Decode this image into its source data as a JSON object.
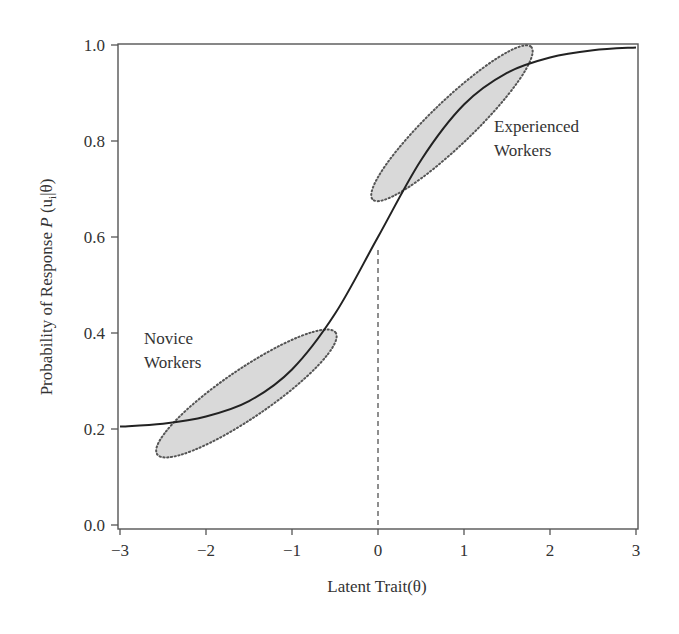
{
  "chart_data": {
    "type": "line",
    "title": "",
    "xlabel": "Latent Trait(θ)",
    "ylabel": {
      "prefix": "Probability of Response ",
      "italic": "P",
      "open": " (u",
      "subscript": "i",
      "close": "|θ)"
    },
    "xlim": [
      -3,
      3
    ],
    "ylim": [
      0.0,
      1.0
    ],
    "grid": false,
    "legend": null,
    "x_ticks": [
      -3,
      -2,
      -1,
      0,
      1,
      2,
      3
    ],
    "x_tick_labels": [
      "−3",
      "−2",
      "−1",
      "0",
      "1",
      "2",
      "3"
    ],
    "y_ticks": [
      0.0,
      0.2,
      0.4,
      0.6,
      0.8,
      1.0
    ],
    "y_tick_labels": [
      "0.0",
      "0.2",
      "0.4",
      "0.6",
      "0.8",
      "1.0"
    ],
    "series": [
      {
        "name": "Item characteristic curve",
        "x": [
          -3,
          -2.5,
          -2,
          -1.5,
          -1,
          -0.5,
          0,
          0.5,
          1,
          1.5,
          2,
          2.5,
          3
        ],
        "values": [
          0.205,
          0.211,
          0.226,
          0.258,
          0.324,
          0.44,
          0.6,
          0.76,
          0.876,
          0.942,
          0.974,
          0.989,
          0.995
        ],
        "color": "#222222"
      }
    ],
    "reference_lines": [
      {
        "type": "vertical-dashed",
        "x": 0,
        "from_y": 0.0,
        "to_y": 0.58
      }
    ],
    "regions": [
      {
        "name": "Novice Workers",
        "center": [
          -1.53,
          0.274
        ],
        "semi_major_px": 108,
        "semi_minor_px": 24,
        "angle_deg": -34.3,
        "fill": "#d9d9d9",
        "stroke": "#555555"
      },
      {
        "name": "Experienced Workers",
        "center": [
          0.86,
          0.837
        ],
        "semi_major_px": 110,
        "semi_minor_px": 22,
        "angle_deg": -43.9,
        "fill": "#d9d9d9",
        "stroke": "#555555"
      }
    ],
    "annotations": [
      {
        "lines": [
          "Novice",
          "Workers"
        ],
        "x": -2.72,
        "y": 0.378
      },
      {
        "lines": [
          "Experienced",
          "Workers"
        ],
        "x": 1.35,
        "y": 0.818
      }
    ]
  }
}
